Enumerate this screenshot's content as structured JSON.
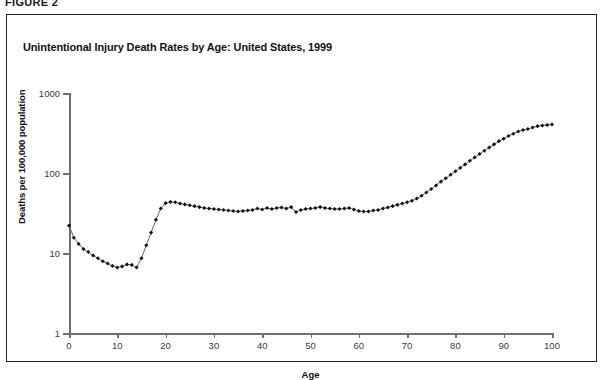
{
  "figure": {
    "label": "FIGURE 2"
  },
  "chart_data": {
    "type": "line",
    "title": "Unintentional Injury Death Rates by Age: United States, 1999",
    "xlabel": "Age",
    "ylabel": "Deaths per 100,000 population",
    "yscale": "log",
    "ylim": [
      1,
      1000
    ],
    "xlim": [
      0,
      100
    ],
    "ytick_labels": [
      "1",
      "10",
      "100",
      "1000"
    ],
    "ytick_values": [
      1,
      10,
      100,
      1000
    ],
    "xtick_labels": [
      "0",
      "10",
      "20",
      "30",
      "40",
      "50",
      "60",
      "70",
      "80",
      "90",
      "100"
    ],
    "xtick_values": [
      0,
      10,
      20,
      30,
      40,
      50,
      60,
      70,
      80,
      90,
      100
    ],
    "grid": false,
    "legend": null,
    "marker": "filled-diamond",
    "line_color": "#555555",
    "marker_color": "#111111",
    "x": [
      0,
      1,
      2,
      3,
      4,
      5,
      6,
      7,
      8,
      9,
      10,
      11,
      12,
      13,
      14,
      15,
      16,
      17,
      18,
      19,
      20,
      21,
      22,
      23,
      24,
      25,
      26,
      27,
      28,
      29,
      30,
      31,
      32,
      33,
      34,
      35,
      36,
      37,
      38,
      39,
      40,
      41,
      42,
      43,
      44,
      45,
      46,
      47,
      48,
      49,
      50,
      51,
      52,
      53,
      54,
      55,
      56,
      57,
      58,
      59,
      60,
      61,
      62,
      63,
      64,
      65,
      66,
      67,
      68,
      69,
      70,
      71,
      72,
      73,
      74,
      75,
      76,
      77,
      78,
      79,
      80,
      81,
      82,
      83,
      84,
      85,
      86,
      87,
      88,
      89,
      90,
      91,
      92,
      93,
      94,
      95,
      96,
      97,
      98,
      99,
      100
    ],
    "values": [
      22.0,
      15.5,
      13.0,
      11.2,
      10.3,
      9.3,
      8.6,
      7.9,
      7.4,
      6.9,
      6.6,
      6.8,
      7.2,
      7.1,
      6.6,
      8.6,
      12.5,
      18.0,
      26.0,
      36.0,
      42.0,
      43.5,
      43.0,
      41.5,
      40.5,
      39.5,
      38.5,
      37.5,
      36.5,
      36.0,
      35.5,
      35.0,
      34.5,
      34.0,
      33.5,
      33.0,
      33.5,
      34.0,
      34.5,
      36.0,
      35.0,
      36.5,
      35.5,
      36.5,
      37.0,
      36.0,
      37.5,
      32.5,
      34.5,
      35.5,
      36.0,
      36.5,
      37.5,
      36.5,
      36.0,
      35.5,
      35.5,
      36.0,
      36.5,
      35.0,
      33.5,
      33.0,
      33.0,
      34.0,
      34.5,
      36.0,
      37.0,
      38.5,
      40.0,
      41.5,
      43.0,
      45.0,
      48.0,
      52.0,
      57.0,
      63.0,
      70.0,
      78.0,
      86.0,
      95.0,
      105.0,
      116.0,
      128.0,
      142.0,
      157.0,
      173.0,
      190.0,
      208.0,
      228.0,
      250.0,
      268.0,
      290.0,
      310.0,
      330.0,
      345.0,
      355.0,
      370.0,
      385.0,
      392.0,
      398.0,
      405.0
    ]
  }
}
